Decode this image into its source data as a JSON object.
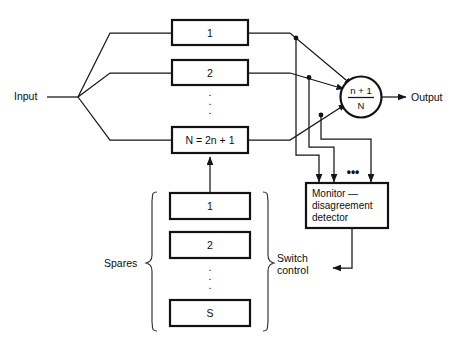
{
  "diagram": {
    "colors": {
      "background": "#ffffff",
      "line": "#151515",
      "box_stroke": "#121212",
      "text": "#0e0e0e"
    },
    "input": {
      "label": "Input"
    },
    "output": {
      "label": "Output"
    },
    "modules": [
      {
        "label": "1"
      },
      {
        "label": "2"
      },
      {
        "label": "N = 2n + 1"
      }
    ],
    "module_ellipsis": "⋮",
    "voter": {
      "numerator": "n + 1",
      "denominator": "N"
    },
    "monitor": {
      "line1": "Monitor —",
      "line2": "disagreement",
      "line3": "detector"
    },
    "monitor_inputs_ellipsis": "•••",
    "spares": {
      "label": "Spares",
      "items": [
        {
          "label": "1"
        },
        {
          "label": "2"
        },
        {
          "label": "S"
        }
      ],
      "ellipsis": "⋮"
    },
    "switch_control": {
      "line1": "Switch",
      "line2": "control"
    }
  }
}
